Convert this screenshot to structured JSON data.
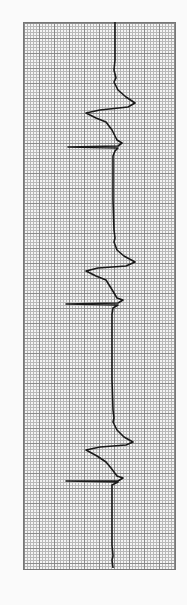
{
  "image": {
    "subject": "ECG rhythm strip on grid paper",
    "orientation": "vertical",
    "trace_color": "#1a1a1a",
    "grid_major_color": "#8a8a8a",
    "grid_minor_color": "#b8b8b8",
    "complex_count": 3
  }
}
